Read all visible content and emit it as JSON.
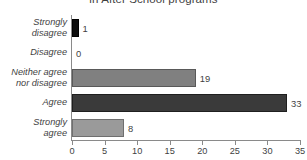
{
  "chart_data": {
    "type": "bar",
    "orientation": "horizontal",
    "title": "in After School programs",
    "xlabel": "",
    "ylabel": "",
    "xlim": [
      0,
      35
    ],
    "xticks": [
      0,
      5,
      10,
      15,
      20,
      25,
      30,
      35
    ],
    "grid": false,
    "legend": false,
    "categories": [
      "Strongly disagree",
      "Disagree",
      "Neither agree nor disagree",
      "Agree",
      "Strongly agree"
    ],
    "values": [
      1,
      0,
      19,
      33,
      8
    ],
    "value_labels": [
      "1",
      "0",
      "19",
      "33",
      "8"
    ],
    "bar_colors": [
      "#0d0d0d",
      "#9a9a9a",
      "#808080",
      "#3a3a3a",
      "#9a9a9a"
    ],
    "bar_border_colors": [
      "#000000",
      "#6f6f6f",
      "#595959",
      "#1f1f1f",
      "#6f6f6f"
    ]
  },
  "axis": {
    "tick_labels": [
      "0",
      "5",
      "10",
      "15",
      "20",
      "25",
      "30",
      "35"
    ],
    "line_color": "#8a8a8a"
  },
  "category_labels": [
    {
      "line1": "Strongly",
      "line2": "disagree"
    },
    {
      "line1": "Disagree",
      "line2": ""
    },
    {
      "line1": "Neither agree",
      "line2": "nor disagree"
    },
    {
      "line1": "Agree",
      "line2": ""
    },
    {
      "line1": "Strongly",
      "line2": "agree"
    }
  ],
  "theme": {
    "background": "#ffffff",
    "text": "#3f3f3f"
  }
}
